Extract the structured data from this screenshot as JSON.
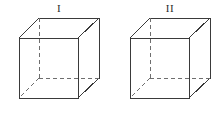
{
  "figure": {
    "type": "geometry-diagram",
    "background_color": "#ffffff",
    "edge_color": "#3a3a3a",
    "hidden_edge_color": "#6e6e6e",
    "label_color": "#2b2b2b",
    "canvas": {
      "width": 220,
      "height": 115
    },
    "cubes": [
      {
        "label": "I",
        "label_x": 59,
        "label_y": 11,
        "front_face": {
          "left": 19,
          "top": 38,
          "right": 78,
          "bottom": 98
        },
        "depth_offset": {
          "dx": 20,
          "dy": -20
        },
        "back_face": {
          "left": 39,
          "top": 18,
          "right": 99,
          "bottom": 78
        },
        "hidden_vertex": {
          "x": 39,
          "y": 78
        },
        "hidden_edges": [
          {
            "from": [
              39,
              18
            ],
            "to": [
              39,
              78
            ]
          },
          {
            "from": [
              39,
              78
            ],
            "to": [
              99,
              78
            ]
          },
          {
            "from": [
              39,
              78
            ],
            "to": [
              19,
              98
            ]
          }
        ]
      },
      {
        "label": "II",
        "label_x": 170,
        "label_y": 11,
        "front_face": {
          "left": 130,
          "top": 38,
          "right": 189,
          "bottom": 98
        },
        "depth_offset": {
          "dx": 20,
          "dy": -20
        },
        "back_face": {
          "left": 150,
          "top": 18,
          "right": 210,
          "bottom": 78
        },
        "hidden_vertex": {
          "x": 150,
          "y": 78
        },
        "hidden_edges": [
          {
            "from": [
              150,
              18
            ],
            "to": [
              150,
              78
            ]
          },
          {
            "from": [
              150,
              78
            ],
            "to": [
              210,
              78
            ]
          },
          {
            "from": [
              150,
              78
            ],
            "to": [
              130,
              98
            ]
          }
        ]
      }
    ]
  }
}
